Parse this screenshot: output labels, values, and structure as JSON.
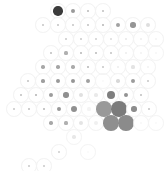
{
  "figure": {
    "title": "",
    "background_color": "#ffffff",
    "cell_outline_color": "#f2f2f2",
    "width": 168,
    "height": 171
  },
  "chart_data": {
    "type": "heatmap",
    "subtype": "hexbin-tile-map",
    "title": "",
    "subtitle": "",
    "xlabel": "",
    "ylabel": "",
    "legend": [],
    "annotations": [],
    "grid": false,
    "layout": {
      "rows": 11,
      "cell_diameter": 15.6,
      "row_step": 14.4,
      "row_offset_step": 7.8,
      "hex_packing": "offset-rows"
    },
    "colormap": {
      "type": "sequential-greys",
      "low": "#ffffff",
      "high": "#3a3a3a"
    },
    "cells": [
      {
        "row": 0,
        "col": 0,
        "cx": 58,
        "cy": 11,
        "value": 0.92,
        "dot_color": "#3b3b3b",
        "dot_scale": 0.62,
        "ring": false
      },
      {
        "row": 0,
        "col": 1,
        "cx": 73,
        "cy": 11,
        "value": 0.42,
        "dot_color": "#9a9a9a",
        "dot_scale": 0.3,
        "ring": false
      },
      {
        "row": 0,
        "col": 2,
        "cx": 88,
        "cy": 11,
        "value": 0.24,
        "dot_color": "#b9b9b9",
        "dot_scale": 0.18,
        "ring": false
      },
      {
        "row": 0,
        "col": 3,
        "cx": 103,
        "cy": 11,
        "value": 0.22,
        "dot_color": "#bfbfbf",
        "dot_scale": 0.17,
        "ring": false
      },
      {
        "row": 1,
        "col": 0,
        "cx": 43,
        "cy": 25,
        "value": 0.2,
        "dot_color": "#c4c4c4",
        "dot_scale": 0.15,
        "ring": false
      },
      {
        "row": 1,
        "col": 1,
        "cx": 58,
        "cy": 25,
        "value": 0.21,
        "dot_color": "#c2c2c2",
        "dot_scale": 0.16,
        "ring": false
      },
      {
        "row": 1,
        "col": 2,
        "cx": 73,
        "cy": 25,
        "value": 0.2,
        "dot_color": "#c4c4c4",
        "dot_scale": 0.15,
        "ring": false
      },
      {
        "row": 1,
        "col": 3,
        "cx": 88,
        "cy": 25,
        "value": 0.22,
        "dot_color": "#c0c0c0",
        "dot_scale": 0.16,
        "ring": false
      },
      {
        "row": 1,
        "col": 4,
        "cx": 103,
        "cy": 25,
        "value": 0.26,
        "dot_color": "#b5b5b5",
        "dot_scale": 0.18,
        "ring": false
      },
      {
        "row": 1,
        "col": 5,
        "cx": 118,
        "cy": 25,
        "value": 0.38,
        "dot_color": "#a2a2a2",
        "dot_scale": 0.26,
        "ring": false
      },
      {
        "row": 1,
        "col": 6,
        "cx": 133,
        "cy": 25,
        "value": 0.46,
        "dot_color": "#959595",
        "dot_scale": 0.34,
        "ring": false
      },
      {
        "row": 1,
        "col": 7,
        "cx": 148,
        "cy": 25,
        "value": 0.12,
        "dot_color": "#dedede",
        "dot_scale": 0.3,
        "ring": false
      },
      {
        "row": 2,
        "col": 0,
        "cx": 66,
        "cy": 39,
        "value": 0.18,
        "dot_color": "#c9c9c9",
        "dot_scale": 0.14,
        "ring": false
      },
      {
        "row": 2,
        "col": 1,
        "cx": 81,
        "cy": 39,
        "value": 0.18,
        "dot_color": "#c9c9c9",
        "dot_scale": 0.14,
        "ring": false
      },
      {
        "row": 2,
        "col": 2,
        "cx": 96,
        "cy": 39,
        "value": 0.16,
        "dot_color": "#cfcfcf",
        "dot_scale": 0.13,
        "ring": false
      },
      {
        "row": 2,
        "col": 3,
        "cx": 111,
        "cy": 39,
        "value": 0.12,
        "dot_color": "#dcdcdc",
        "dot_scale": 0.12,
        "ring": false
      },
      {
        "row": 2,
        "col": 4,
        "cx": 126,
        "cy": 39,
        "value": 0.08,
        "dot_color": "#e8e8e8",
        "dot_scale": 0.12,
        "ring": false
      },
      {
        "row": 2,
        "col": 5,
        "cx": 141,
        "cy": 39,
        "value": 0.05,
        "dot_color": "#f0f0f0",
        "dot_scale": 0.1,
        "ring": false
      },
      {
        "row": 2,
        "col": 6,
        "cx": 156,
        "cy": 39,
        "value": 0.03,
        "dot_color": "#f5f5f5",
        "dot_scale": 0.1,
        "ring": false
      },
      {
        "row": 3,
        "col": 0,
        "cx": 51,
        "cy": 53,
        "value": 0.24,
        "dot_color": "#bcbcbc",
        "dot_scale": 0.17,
        "ring": false
      },
      {
        "row": 3,
        "col": 1,
        "cx": 66,
        "cy": 53,
        "value": 0.3,
        "dot_color": "#b0b0b0",
        "dot_scale": 0.2,
        "ring": false
      },
      {
        "row": 3,
        "col": 2,
        "cx": 81,
        "cy": 53,
        "value": 0.28,
        "dot_color": "#b4b4b4",
        "dot_scale": 0.19,
        "ring": false
      },
      {
        "row": 3,
        "col": 3,
        "cx": 96,
        "cy": 53,
        "value": 0.26,
        "dot_color": "#b8b8b8",
        "dot_scale": 0.18,
        "ring": false
      },
      {
        "row": 3,
        "col": 4,
        "cx": 111,
        "cy": 53,
        "value": 0.22,
        "dot_color": "#c2c2c2",
        "dot_scale": 0.16,
        "ring": false
      },
      {
        "row": 3,
        "col": 5,
        "cx": 126,
        "cy": 53,
        "value": 0.06,
        "dot_color": "#ececec",
        "dot_scale": 0.14,
        "ring": false
      },
      {
        "row": 3,
        "col": 6,
        "cx": 141,
        "cy": 53,
        "value": 0.04,
        "dot_color": "#f2f2f2",
        "dot_scale": 0.12,
        "ring": false
      },
      {
        "row": 3,
        "col": 7,
        "cx": 156,
        "cy": 53,
        "value": 0.02,
        "dot_color": "#f7f7f7",
        "dot_scale": 0.1,
        "ring": true
      },
      {
        "row": 4,
        "col": 0,
        "cx": 43,
        "cy": 67,
        "value": 0.34,
        "dot_color": "#a8a8a8",
        "dot_scale": 0.22,
        "ring": false
      },
      {
        "row": 4,
        "col": 1,
        "cx": 58,
        "cy": 67,
        "value": 0.36,
        "dot_color": "#a5a5a5",
        "dot_scale": 0.23,
        "ring": false
      },
      {
        "row": 4,
        "col": 2,
        "cx": 73,
        "cy": 67,
        "value": 0.32,
        "dot_color": "#ababab",
        "dot_scale": 0.21,
        "ring": false
      },
      {
        "row": 4,
        "col": 3,
        "cx": 88,
        "cy": 67,
        "value": 0.28,
        "dot_color": "#b4b4b4",
        "dot_scale": 0.19,
        "ring": false
      },
      {
        "row": 4,
        "col": 4,
        "cx": 103,
        "cy": 67,
        "value": 0.2,
        "dot_color": "#c6c6c6",
        "dot_scale": 0.16,
        "ring": false
      },
      {
        "row": 4,
        "col": 5,
        "cx": 118,
        "cy": 67,
        "value": 0.06,
        "dot_color": "#ededed",
        "dot_scale": 0.14,
        "ring": false
      },
      {
        "row": 4,
        "col": 6,
        "cx": 133,
        "cy": 67,
        "value": 0.1,
        "dot_color": "#e4e4e4",
        "dot_scale": 0.2,
        "ring": false
      },
      {
        "row": 4,
        "col": 7,
        "cx": 148,
        "cy": 67,
        "value": 0.04,
        "dot_color": "#f2f2f2",
        "dot_scale": 0.14,
        "ring": false
      },
      {
        "row": 5,
        "col": 0,
        "cx": 28,
        "cy": 81,
        "value": 0.22,
        "dot_color": "#c2c2c2",
        "dot_scale": 0.16,
        "ring": false
      },
      {
        "row": 5,
        "col": 1,
        "cx": 43,
        "cy": 81,
        "value": 0.38,
        "dot_color": "#9f9f9f",
        "dot_scale": 0.24,
        "ring": false
      },
      {
        "row": 5,
        "col": 2,
        "cx": 58,
        "cy": 81,
        "value": 0.44,
        "dot_color": "#999999",
        "dot_scale": 0.28,
        "ring": false
      },
      {
        "row": 5,
        "col": 3,
        "cx": 73,
        "cy": 81,
        "value": 0.46,
        "dot_color": "#969696",
        "dot_scale": 0.32,
        "ring": false
      },
      {
        "row": 5,
        "col": 4,
        "cx": 88,
        "cy": 81,
        "value": 0.4,
        "dot_color": "#a0a0a0",
        "dot_scale": 0.3,
        "ring": false
      },
      {
        "row": 5,
        "col": 5,
        "cx": 103,
        "cy": 81,
        "value": 0.02,
        "dot_color": "#fafafa",
        "dot_scale": 0.1,
        "ring": true
      },
      {
        "row": 5,
        "col": 6,
        "cx": 118,
        "cy": 81,
        "value": 0.14,
        "dot_color": "#d8d8d8",
        "dot_scale": 0.22,
        "ring": false
      },
      {
        "row": 5,
        "col": 7,
        "cx": 133,
        "cy": 81,
        "value": 0.42,
        "dot_color": "#9c9c9c",
        "dot_scale": 0.26,
        "ring": false
      },
      {
        "row": 5,
        "col": 8,
        "cx": 148,
        "cy": 81,
        "value": 0.2,
        "dot_color": "#c6c6c6",
        "dot_scale": 0.16,
        "ring": false
      },
      {
        "row": 6,
        "col": 0,
        "cx": 21,
        "cy": 95,
        "value": 0.24,
        "dot_color": "#bebebe",
        "dot_scale": 0.16,
        "ring": false
      },
      {
        "row": 6,
        "col": 1,
        "cx": 36,
        "cy": 95,
        "value": 0.3,
        "dot_color": "#b0b0b0",
        "dot_scale": 0.19,
        "ring": false
      },
      {
        "row": 6,
        "col": 2,
        "cx": 51,
        "cy": 95,
        "value": 0.42,
        "dot_color": "#9c9c9c",
        "dot_scale": 0.26,
        "ring": false
      },
      {
        "row": 6,
        "col": 3,
        "cx": 66,
        "cy": 95,
        "value": 0.5,
        "dot_color": "#909090",
        "dot_scale": 0.34,
        "ring": false
      },
      {
        "row": 6,
        "col": 4,
        "cx": 81,
        "cy": 95,
        "value": 0.12,
        "dot_color": "#e0e0e0",
        "dot_scale": 0.26,
        "ring": false
      },
      {
        "row": 6,
        "col": 5,
        "cx": 96,
        "cy": 95,
        "value": 0.08,
        "dot_color": "#eaeaea",
        "dot_scale": 0.24,
        "ring": false
      },
      {
        "row": 6,
        "col": 6,
        "cx": 111,
        "cy": 95,
        "value": 0.62,
        "dot_color": "#7e7e7e",
        "dot_scale": 0.56,
        "ring": false
      },
      {
        "row": 6,
        "col": 7,
        "cx": 126,
        "cy": 95,
        "value": 0.48,
        "dot_color": "#939393",
        "dot_scale": 0.32,
        "ring": false
      },
      {
        "row": 6,
        "col": 8,
        "cx": 141,
        "cy": 95,
        "value": 0.24,
        "dot_color": "#bebebe",
        "dot_scale": 0.17,
        "ring": false
      },
      {
        "row": 7,
        "col": 0,
        "cx": 14,
        "cy": 109,
        "value": 0.2,
        "dot_color": "#c6c6c6",
        "dot_scale": 0.15,
        "ring": false
      },
      {
        "row": 7,
        "col": 1,
        "cx": 29,
        "cy": 109,
        "value": 0.24,
        "dot_color": "#bebebe",
        "dot_scale": 0.16,
        "ring": false
      },
      {
        "row": 7,
        "col": 2,
        "cx": 44,
        "cy": 109,
        "value": 0.28,
        "dot_color": "#b6b6b6",
        "dot_scale": 0.18,
        "ring": false
      },
      {
        "row": 7,
        "col": 3,
        "cx": 59,
        "cy": 109,
        "value": 0.44,
        "dot_color": "#999999",
        "dot_scale": 0.27,
        "ring": false
      },
      {
        "row": 7,
        "col": 4,
        "cx": 74,
        "cy": 109,
        "value": 0.5,
        "dot_color": "#909090",
        "dot_scale": 0.4,
        "ring": false
      },
      {
        "row": 7,
        "col": 5,
        "cx": 89,
        "cy": 109,
        "value": 0.04,
        "dot_color": "#f4f4f4",
        "dot_scale": 0.2,
        "ring": true
      },
      {
        "row": 7,
        "col": 6,
        "cx": 104,
        "cy": 109,
        "value": 0.66,
        "dot_color": "#999999",
        "dot_scale": 1.0,
        "ring": false
      },
      {
        "row": 7,
        "col": 7,
        "cx": 119,
        "cy": 109,
        "value": 0.8,
        "dot_color": "#7b7b7b",
        "dot_scale": 1.0,
        "ring": false
      },
      {
        "row": 7,
        "col": 8,
        "cx": 134,
        "cy": 109,
        "value": 0.52,
        "dot_color": "#8d8d8d",
        "dot_scale": 0.34,
        "ring": false
      },
      {
        "row": 7,
        "col": 9,
        "cx": 149,
        "cy": 109,
        "value": 0.22,
        "dot_color": "#c2c2c2",
        "dot_scale": 0.16,
        "ring": false
      },
      {
        "row": 8,
        "col": 0,
        "cx": 51,
        "cy": 123,
        "value": 0.34,
        "dot_color": "#a8a8a8",
        "dot_scale": 0.22,
        "ring": false
      },
      {
        "row": 8,
        "col": 1,
        "cx": 66,
        "cy": 123,
        "value": 0.3,
        "dot_color": "#b0b0b0",
        "dot_scale": 0.2,
        "ring": false
      },
      {
        "row": 8,
        "col": 2,
        "cx": 81,
        "cy": 123,
        "value": 0.1,
        "dot_color": "#e4e4e4",
        "dot_scale": 0.26,
        "ring": false
      },
      {
        "row": 8,
        "col": 3,
        "cx": 96,
        "cy": 123,
        "value": 0.05,
        "dot_color": "#f0f0f0",
        "dot_scale": 0.3,
        "ring": false
      },
      {
        "row": 8,
        "col": 4,
        "cx": 111,
        "cy": 123,
        "value": 0.7,
        "dot_color": "#8f8f8f",
        "dot_scale": 1.0,
        "ring": false
      },
      {
        "row": 8,
        "col": 5,
        "cx": 126,
        "cy": 123,
        "value": 0.72,
        "dot_color": "#8b8b8b",
        "dot_scale": 1.0,
        "ring": false
      },
      {
        "row": 8,
        "col": 6,
        "cx": 141,
        "cy": 123,
        "value": 0.03,
        "dot_color": "#f7f7f7",
        "dot_scale": 0.14,
        "ring": true
      },
      {
        "row": 8,
        "col": 7,
        "cx": 156,
        "cy": 123,
        "value": 0.02,
        "dot_color": "#fafafa",
        "dot_scale": 0.1,
        "ring": true
      },
      {
        "row": 9,
        "col": 0,
        "cx": 74,
        "cy": 137,
        "value": 0.08,
        "dot_color": "#e8e8e8",
        "dot_scale": 0.22,
        "ring": true
      },
      {
        "row": 10,
        "col": 0,
        "cx": 59,
        "cy": 152,
        "value": 0.18,
        "dot_color": "#cccccc",
        "dot_scale": 0.16,
        "ring": false
      },
      {
        "row": 10,
        "col": 1,
        "cx": 88,
        "cy": 152,
        "value": 0.01,
        "dot_color": "#fbfbfb",
        "dot_scale": 0.08,
        "ring": true
      },
      {
        "row": 11,
        "col": 0,
        "cx": 29,
        "cy": 166,
        "value": 0.2,
        "dot_color": "#c8c8c8",
        "dot_scale": 0.16,
        "ring": false
      },
      {
        "row": 11,
        "col": 1,
        "cx": 44,
        "cy": 166,
        "value": 0.2,
        "dot_color": "#c8c8c8",
        "dot_scale": 0.16,
        "ring": false
      }
    ]
  }
}
